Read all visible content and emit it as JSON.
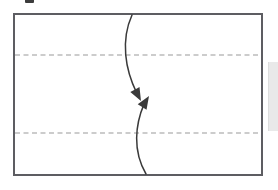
{
  "figure": {
    "title": "",
    "caption": "",
    "background_color": "#ffffff",
    "frame": {
      "border_color": "#5d5d62",
      "border_width_px": 2,
      "fill": "#ffffff",
      "x": 13,
      "y": 13,
      "width": 250,
      "height": 163
    }
  },
  "diagram_data": {
    "type": "schematic",
    "description": "Rectangular region crossed by two horizontal dashed reference lines, with two opposing curved arrows meeting head-to-head near the vertical center.",
    "reference_lines": [
      {
        "name": "upper-dashed-line",
        "orientation": "horizontal",
        "y": 55,
        "x_start": 15,
        "x_end": 261,
        "color": "#9a9a9a",
        "style": "dashed"
      },
      {
        "name": "lower-dashed-line",
        "orientation": "horizontal",
        "y": 133,
        "x_start": 15,
        "x_end": 261,
        "color": "#9a9a9a",
        "style": "dashed"
      }
    ],
    "arrows": [
      {
        "name": "downward-curved-arrow",
        "direction": "downward",
        "color": "#3a3a3a",
        "tail": {
          "x": 132,
          "y": 15
        },
        "head": {
          "x": 141,
          "y": 101
        },
        "head_angle_deg": 62,
        "curvature": "bows left of chord, crosses upper dashed line"
      },
      {
        "name": "upward-curved-arrow",
        "direction": "upward",
        "color": "#3a3a3a",
        "tail": {
          "x": 146,
          "y": 174
        },
        "head": {
          "x": 149,
          "y": 96
        },
        "head_angle_deg": -58,
        "curvature": "bows left of chord, crosses lower dashed line"
      }
    ],
    "annotations": [],
    "artifacts": [
      {
        "name": "clipped-glyph-fragment",
        "x": 25,
        "y": 0,
        "width": 9,
        "height": 3,
        "color": "#3c3c3c"
      },
      {
        "name": "page-edge-strip",
        "x": 268,
        "y": 62,
        "width": 11,
        "height": 69,
        "color": "#e9e9e9"
      }
    ]
  },
  "colors": {
    "frame_border": "#5d5d62",
    "dash_gray": "#9a9a9a",
    "arrow_dark": "#3a3a3a",
    "edge_strip": "#e9e9e9",
    "background": "#ffffff"
  }
}
